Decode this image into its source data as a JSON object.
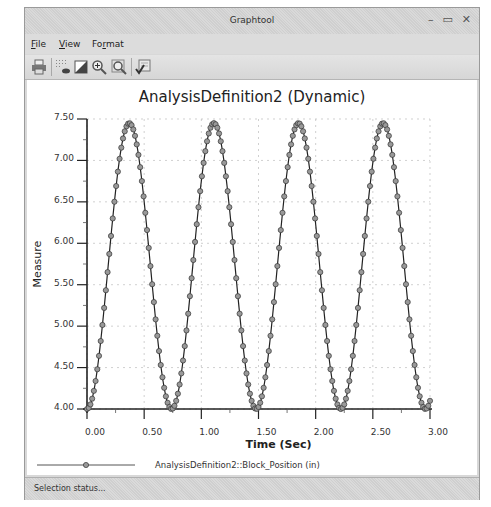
{
  "window": {
    "title": "Graphtool",
    "controls": {
      "minimize": "–",
      "maximize": "▭",
      "close": "✕"
    }
  },
  "menu": {
    "items": [
      {
        "label": "File",
        "mnemonic": "F"
      },
      {
        "label": "View",
        "mnemonic": "V"
      },
      {
        "label": "Format",
        "mnemonic": "r"
      }
    ]
  },
  "toolbar": {
    "buttons": [
      {
        "icon": "print-icon"
      },
      {
        "icon": "grid-toggle-icon"
      },
      {
        "icon": "background-color-icon"
      },
      {
        "icon": "zoom-in-icon"
      },
      {
        "icon": "zoom-fit-icon"
      },
      {
        "icon": "format-graph-icon"
      }
    ]
  },
  "status": {
    "text": "Selection status..."
  },
  "legend": {
    "label": "AnalysisDefinition2::Block_Position (in)"
  },
  "chart_data": {
    "type": "line",
    "title": "AnalysisDefinition2 (Dynamic)",
    "xlabel": "Time (Sec)",
    "ylabel": "Measure",
    "xlim": [
      0,
      3.0
    ],
    "ylim": [
      4.0,
      7.5
    ],
    "xticks": [
      "0.00",
      "0.50",
      "1.00",
      "1.50",
      "2.00",
      "2.50",
      "3.00"
    ],
    "yticks": [
      "4.00",
      "4.50",
      "5.00",
      "5.50",
      "6.00",
      "6.50",
      "7.00",
      "7.50"
    ],
    "grid": true,
    "legend_position": "bottom",
    "series": [
      {
        "name": "AnalysisDefinition2::Block_Position (in)",
        "marker": "circle",
        "color": "#333333",
        "model": "y = 5.725 - 1.725*cos(2*pi*t/0.74)",
        "min": 4.0,
        "max": 7.45,
        "period_sec": 0.74,
        "peaks_t": [
          0.37,
          1.11,
          1.85,
          2.59
        ],
        "valleys_t": [
          0.0,
          0.74,
          1.48,
          2.22,
          2.96
        ],
        "x": [
          0.0,
          0.1,
          0.2,
          0.3,
          0.37,
          0.5,
          0.6,
          0.74,
          0.9,
          1.0,
          1.11,
          1.2,
          1.3,
          1.48,
          1.6,
          1.7,
          1.85,
          2.0,
          2.1,
          2.22,
          2.4,
          2.5,
          2.59,
          2.7,
          2.8,
          2.96,
          3.0
        ],
        "y": [
          4.0,
          4.48,
          5.61,
          6.91,
          7.45,
          6.73,
          5.36,
          4.0,
          4.81,
          5.92,
          7.45,
          7.18,
          6.24,
          4.0,
          4.37,
          5.21,
          7.45,
          6.86,
          5.97,
          4.0,
          4.91,
          6.03,
          7.45,
          7.12,
          6.36,
          4.0,
          4.03
        ]
      }
    ]
  }
}
